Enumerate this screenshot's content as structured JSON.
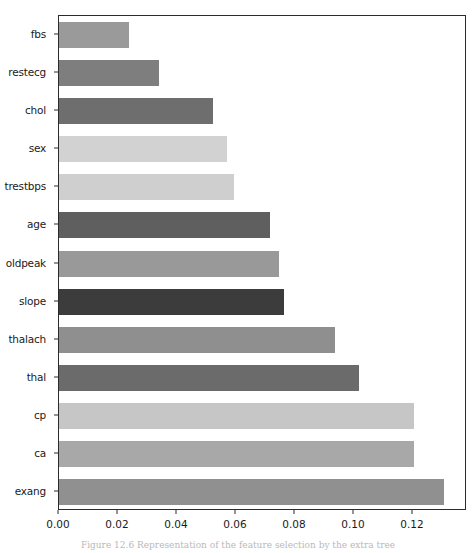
{
  "chart_data": {
    "type": "bar",
    "orientation": "horizontal",
    "title": "",
    "xlabel": "",
    "ylabel": "",
    "categories": [
      "fbs",
      "restecg",
      "chol",
      "sex",
      "trestbps",
      "age",
      "oldpeak",
      "slope",
      "thalach",
      "thal",
      "cp",
      "ca",
      "exang"
    ],
    "values": [
      0.0237,
      0.0339,
      0.0522,
      0.0569,
      0.0593,
      0.0715,
      0.0746,
      0.0763,
      0.0936,
      0.1017,
      0.1203,
      0.1203,
      0.1305
    ],
    "bar_colors": [
      "#9a9a9a",
      "#7e7e7e",
      "#6e6e6e",
      "#d2d2d2",
      "#cfcfcf",
      "#5f5f5f",
      "#999999",
      "#3c3c3c",
      "#8f8f8f",
      "#6b6b6b",
      "#c6c6c6",
      "#a8a8a8",
      "#909090"
    ],
    "xlim": [
      0.0,
      0.1383
    ],
    "ylim_categories_order": "top-to-bottom",
    "xticks": [
      0.0,
      0.02,
      0.04,
      0.06,
      0.08,
      0.1,
      0.12
    ],
    "xtick_labels": [
      "0.00",
      "0.02",
      "0.04",
      "0.06",
      "0.08",
      "0.10",
      "0.12"
    ],
    "grid": false,
    "legend": null,
    "axis_color": "#2b2b2b",
    "background_color": "#ffffff"
  },
  "caption": {
    "text": "Figure 12.6  Representation of the feature selection by the extra tree"
  }
}
